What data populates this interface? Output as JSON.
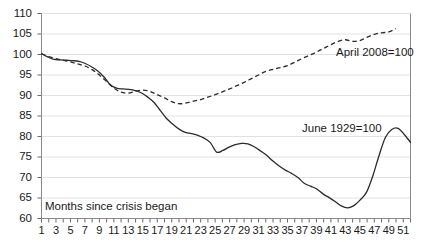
{
  "chart_data": {
    "type": "line",
    "title": "",
    "subtitle": "",
    "xlabel": "Months since crisis began",
    "ylabel": "",
    "xlim": [
      1,
      52
    ],
    "ylim": [
      60,
      110
    ],
    "ytick_step": 5,
    "grid": true,
    "legend_position": "inline-annotation",
    "ytick_labels": [
      "110",
      "105",
      "100",
      "95",
      "90",
      "85",
      "80",
      "75",
      "70",
      "65",
      "60"
    ],
    "ytick_values": [
      110,
      105,
      100,
      95,
      90,
      85,
      80,
      75,
      70,
      65,
      60
    ],
    "xtick_labels": [
      "1",
      "3",
      "5",
      "7",
      "9",
      "11",
      "13",
      "15",
      "17",
      "19",
      "21",
      "23",
      "25",
      "27",
      "29",
      "31",
      "33",
      "35",
      "37",
      "39",
      "41",
      "43",
      "45",
      "47",
      "49",
      "51"
    ],
    "xtick_values": [
      1,
      3,
      5,
      7,
      9,
      11,
      13,
      15,
      17,
      19,
      21,
      23,
      25,
      27,
      29,
      31,
      33,
      35,
      37,
      39,
      41,
      43,
      45,
      47,
      49,
      51
    ],
    "x": [
      1,
      2,
      3,
      4,
      5,
      6,
      7,
      8,
      9,
      10,
      11,
      12,
      13,
      14,
      15,
      16,
      17,
      18,
      19,
      20,
      21,
      22,
      23,
      24,
      25,
      26,
      27,
      28,
      29,
      30,
      31,
      32,
      33,
      34,
      35,
      36,
      37,
      38,
      39,
      40,
      41,
      42,
      43,
      44,
      45,
      46,
      47,
      48,
      49,
      50,
      51,
      52
    ],
    "series": [
      {
        "name": "June 1929=100",
        "style": "solid",
        "color": "#2b2b2b",
        "annotation": "June 1929=100",
        "values": [
          100.2,
          99.4,
          98.8,
          98.7,
          98.6,
          98.5,
          98.3,
          97.8,
          97.0,
          96.0,
          94.5,
          92.6,
          91.8,
          91.6,
          91.5,
          91.2,
          90.6,
          89.6,
          88.3,
          86.3,
          84.4,
          83.0,
          81.8,
          81.0,
          80.7,
          80.3,
          79.6,
          78.5,
          76.2,
          76.6,
          77.4,
          78.0,
          78.3,
          78.2,
          77.5,
          76.5,
          75.4,
          74.0,
          72.8,
          71.8,
          71.0,
          70.0,
          68.6,
          67.9,
          67.2,
          66.0,
          65.1,
          64.1,
          63.0,
          62.6,
          63.2,
          64.6
        ]
      },
      {
        "name": "April 2008=100",
        "style": "dashed",
        "color": "#2b2b2b",
        "annotation": "April 2008=100",
        "values": [
          100.2,
          99.5,
          99.0,
          98.6,
          98.2,
          97.7,
          97.2,
          96.3,
          95.0,
          93.4,
          91.8,
          90.8,
          90.6,
          91.0,
          91.3,
          91.0,
          90.2,
          89.4,
          88.5,
          88.0,
          88.2,
          88.6,
          89.0,
          89.6,
          90.2,
          90.9,
          91.6,
          92.4,
          93.2,
          94.1,
          95.0,
          95.9,
          96.4,
          96.8,
          97.3,
          98.1,
          99.0,
          99.8,
          100.6,
          101.5,
          102.4,
          103.2,
          103.6,
          103.2,
          103.4,
          104.2,
          104.9,
          105.3,
          105.5,
          106.3,
          null,
          null
        ]
      }
    ],
    "solid_extra": {
      "note": "solid series continues to month 52",
      "values_tail": [
        64.6,
        66.5,
        70.5,
        75.5,
        79.8,
        81.7,
        82.0,
        80.5,
        78.6
      ]
    },
    "annotations": [
      {
        "text": "April 2008=100",
        "x_px": 336,
        "y_px": 46
      },
      {
        "text": "June 1929=100",
        "x_px": 302,
        "y_px": 122
      },
      {
        "text": "Months since crisis began",
        "x_px": 45,
        "y_px": 200
      }
    ]
  },
  "axis": {
    "x_caption": "Months since crisis began"
  }
}
